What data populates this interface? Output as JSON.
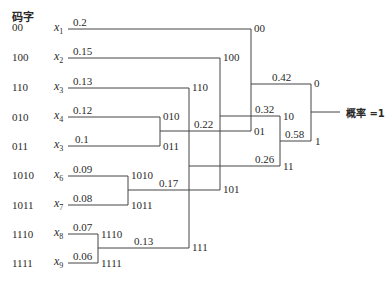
{
  "header": {
    "codeword_label": "码字"
  },
  "symbols": [
    {
      "name": "x",
      "sub": "1",
      "prob": "0.2",
      "code": "00"
    },
    {
      "name": "x",
      "sub": "2",
      "prob": "0.15",
      "code": "100"
    },
    {
      "name": "x",
      "sub": "3",
      "prob": "0.13",
      "code": "110"
    },
    {
      "name": "x",
      "sub": "4",
      "prob": "0.12",
      "code": "010"
    },
    {
      "name": "x",
      "sub": "3",
      "prob": "0.1",
      "code": "011"
    },
    {
      "name": "x",
      "sub": "6",
      "prob": "0.09",
      "code": "1010"
    },
    {
      "name": "x",
      "sub": "7",
      "prob": "0.08",
      "code": "1011"
    },
    {
      "name": "x",
      "sub": "8",
      "prob": "0.07",
      "code": "1110"
    },
    {
      "name": "x",
      "sub": "9",
      "prob": "0.06",
      "code": "1111"
    }
  ],
  "merges": [
    {
      "prob": "0.22",
      "code": "01"
    },
    {
      "prob": "0.17",
      "code": "101"
    },
    {
      "prob": "0.13",
      "code": "111"
    },
    {
      "prob": "0.26",
      "code": "11"
    },
    {
      "prob": "0.32",
      "code": "10"
    },
    {
      "prob": "0.58",
      "code": "1"
    },
    {
      "prob": "0.42",
      "code": "0"
    }
  ],
  "leaf_node_labels": {
    "x1": "00",
    "x2": "100",
    "x3": "110",
    "x4": "010",
    "x5": "011",
    "x6": "1010",
    "x7": "1011",
    "x8": "1110",
    "x9": "1111"
  },
  "root": {
    "label": "概率 =1"
  }
}
